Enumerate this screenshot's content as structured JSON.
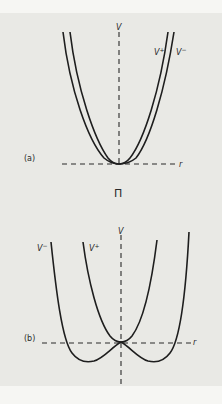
{
  "figure": {
    "symbol_between_panels": "Π",
    "colors": {
      "background": "#e9e9e5",
      "margin": "#f6f6f3",
      "ink": "#1e1e1e"
    },
    "panels": [
      {
        "id": "a",
        "label": "(a)",
        "axis_v_label": "V",
        "axis_r_label": "r",
        "curves": [
          {
            "name": "V+",
            "label_base": "V",
            "label_sup": "+",
            "shape": "single-well, narrow"
          },
          {
            "name": "V-",
            "label_base": "V",
            "label_sup": "−",
            "shape": "single-well, slightly wider"
          }
        ],
        "note": "Both curves touch r-axis at the origin (single minimum)"
      },
      {
        "id": "b",
        "label": "(b)",
        "axis_v_label": "V",
        "axis_r_label": "r",
        "curves": [
          {
            "name": "V-",
            "label_base": "V",
            "label_sup": "−",
            "shape": "double-well, local maximum at origin"
          },
          {
            "name": "V+",
            "label_base": "V",
            "label_sup": "+",
            "shape": "single-well, minimum at origin"
          }
        ],
        "note": "Curves intersect at the origin on the r-axis"
      }
    ]
  }
}
